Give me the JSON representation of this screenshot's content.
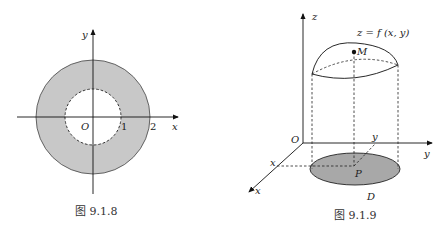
{
  "figure1": {
    "caption": "图 9.1.8",
    "axis_x": "x",
    "axis_y": "y",
    "origin": "O",
    "tick1": "1",
    "tick2": "2",
    "fill_color": "#c8c8c8"
  },
  "figure2": {
    "caption": "图 9.1.9",
    "axis_z": "z",
    "axis_y": "y",
    "axis_x": "x",
    "origin": "O",
    "surface_label": "z = f (x, y)",
    "point_M": "M",
    "point_P": "P",
    "region_D": "D",
    "proj_x": "x",
    "proj_y": "y",
    "fill_color": "#a8a8a8"
  }
}
